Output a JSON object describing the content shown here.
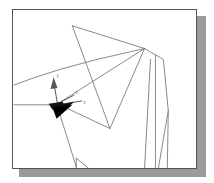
{
  "window": {
    "title": "3D Wireframe Viewport",
    "background_color": "#ffffff",
    "frame_border_color": "#555555",
    "shadow_color": "#9a9a9a"
  },
  "viewport": {
    "name": "wireframe-viewport",
    "wire_color": "#6b6b6b",
    "wire_width": 0.8,
    "width": 185,
    "height": 160
  },
  "axis_marker": {
    "name": "coordinate-axis-triad",
    "origin_label": "origin",
    "x_label": "x",
    "y_label": "y",
    "z_label": "z",
    "x_color": "#111111",
    "y_color": "#555555",
    "z_color": "#333333",
    "origin_color": "#111111"
  },
  "geometry": {
    "type": "wireframe",
    "description": "3D polygonal mesh wireframe rendered in perspective",
    "polylines": [
      {
        "name": "upper-triangle-face",
        "points": "60,16 133,39 98,120 60,16"
      },
      {
        "name": "right-polygon-face",
        "points": "133,39 152,50 157,102 147,160"
      },
      {
        "name": "horizon-ridge-left",
        "points": "1,76 20,69 48,60 85,50 133,39"
      },
      {
        "name": "ridge-to-origin",
        "points": "133,39 45,95"
      },
      {
        "name": "origin-to-lower-right",
        "points": "45,95 98,120"
      },
      {
        "name": "left-horizontal-edge",
        "points": "1,96 45,96"
      },
      {
        "name": "origin-descender",
        "points": "45,98 64,159"
      },
      {
        "name": "bottom-left-vertical",
        "points": "64,150 64,160"
      },
      {
        "name": "bottom-left-diagonal",
        "points": "64,150 76,160"
      },
      {
        "name": "right-near-vertical-a",
        "points": "139,50 133,160"
      },
      {
        "name": "right-near-vertical-b",
        "points": "144,46 144,160"
      },
      {
        "name": "lower-right-edge",
        "points": "157,102 156,160"
      }
    ]
  }
}
